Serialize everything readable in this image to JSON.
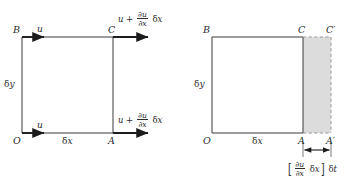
{
  "figure": {
    "domain": "fluid-element-linear-deformation",
    "colors": {
      "stroke": "#2b2b2b",
      "shade_fill": "#dcdcdc",
      "shade_stroke": "#9a9a9a",
      "background": "#ffffff"
    }
  },
  "symbols": {
    "delta": "δ",
    "partial": "∂",
    "prime": "′",
    "bracket_left": "[",
    "bracket_right": "]"
  },
  "left_panel": {
    "name": "velocity-field-panel",
    "points": {
      "O": "O",
      "A": "A",
      "B": "B",
      "C": "C"
    },
    "dimensions": {
      "width_label_delta": "δ",
      "width_label_var": "x",
      "height_label_delta": "δ",
      "height_label_var": "y"
    },
    "velocity_in_top": "u",
    "velocity_in_bottom": "u",
    "velocity_out_top": {
      "base": "u",
      "operator": "+",
      "numerator": "∂u",
      "denominator": "∂x",
      "multiplier_delta": "δ",
      "multiplier_var": "x"
    },
    "velocity_out_bottom": {
      "base": "u",
      "operator": "+",
      "numerator": "∂u",
      "denominator": "∂x",
      "multiplier_delta": "δ",
      "multiplier_var": "x"
    }
  },
  "right_panel": {
    "name": "deformed-element-panel",
    "points": {
      "O": "O",
      "A": "A",
      "B": "B",
      "C": "C",
      "A_prime": "A′",
      "C_prime": "C′"
    },
    "dimensions": {
      "width_label_delta": "δ",
      "width_label_var": "x",
      "height_label_delta": "δ",
      "height_label_var": "y"
    },
    "deformation_label": {
      "bracket_left": "[",
      "numerator": "∂u",
      "denominator": "∂x",
      "inner_delta": "δ",
      "inner_var": "x",
      "bracket_right": "]",
      "time_delta": "δ",
      "time_var": "t"
    }
  }
}
